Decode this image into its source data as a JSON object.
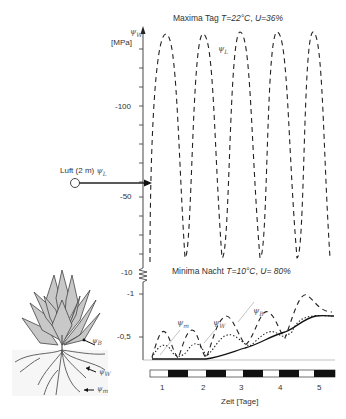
{
  "diagram": {
    "title_top": {
      "prefix": "Maxima Tag",
      "T": "T=22°C",
      "sep": ",",
      "U": "U=36%"
    },
    "title_bottom": {
      "prefix": "Minima Nacht",
      "T": "T=10°C",
      "sep": ",",
      "U": "U= 80%"
    },
    "y_axis": {
      "symbol": "ψ",
      "symbol_sub": "W",
      "unit": "[MPa]",
      "tick_labels": [
        "-100",
        "-50",
        "-10",
        "-1",
        "-0,5"
      ]
    },
    "x_axis": {
      "label": "Zeit [Tage]",
      "tick_labels": [
        "1",
        "2",
        "3",
        "4",
        "5"
      ],
      "day_night_bar": [
        "day",
        "night",
        "day",
        "night",
        "day",
        "night",
        "day",
        "night",
        "day",
        "night"
      ]
    },
    "air_source": {
      "label": "Luft (2 m)",
      "symbol": "ψ",
      "symbol_sub": "L"
    },
    "curve_labels": {
      "psi_L": {
        "symbol": "ψ",
        "sub": "L"
      },
      "psi_m": {
        "symbol": "ψ",
        "sub": "m"
      },
      "psi_W": {
        "symbol": "ψ",
        "sub": "W"
      },
      "psi_B": {
        "symbol": "ψ",
        "sub": "B"
      }
    },
    "plant_labels": {
      "psi_B": {
        "symbol": "ψ",
        "sub": "B"
      },
      "psi_W": {
        "symbol": "ψ",
        "sub": "W"
      },
      "psi_m": {
        "symbol": "ψ",
        "sub": "m"
      }
    },
    "colors": {
      "leaf_fill": "#c8c8c8",
      "line": "#222222",
      "bar_dark": "#111111",
      "bar_light": "#ffffff"
    }
  }
}
